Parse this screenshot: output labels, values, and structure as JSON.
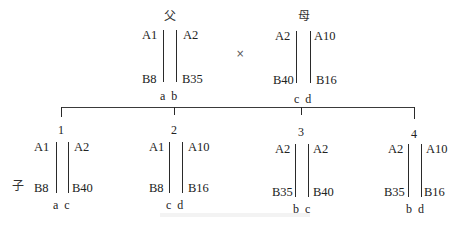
{
  "parents": {
    "father": {
      "title": "父",
      "left_top": "A1",
      "right_top": "A2",
      "left_bottom": "B8",
      "right_bottom": "B35",
      "chrom_labels": "a  b"
    },
    "cross_symbol": "×",
    "mother": {
      "title": "母",
      "left_top": "A2",
      "right_top": "A10",
      "left_bottom": "B40",
      "right_bottom": "B16",
      "chrom_labels": "c  d"
    }
  },
  "offspring_label": "子",
  "children": [
    {
      "number": "1",
      "left_top": "A1",
      "right_top": "A2",
      "left_bottom": "B8",
      "right_bottom": "B40",
      "chrom_labels": "a  c"
    },
    {
      "number": "2",
      "left_top": "A1",
      "right_top": "A10",
      "left_bottom": "B8",
      "right_bottom": "B16",
      "chrom_labels": "c  d"
    },
    {
      "number": "3",
      "left_top": "A2",
      "right_top": "A2",
      "left_bottom": "B35",
      "right_bottom": "B40",
      "chrom_labels": "b  c"
    },
    {
      "number": "4",
      "left_top": "A2",
      "right_top": "A10",
      "left_bottom": "B35",
      "right_bottom": "B16",
      "chrom_labels": "b  d"
    }
  ]
}
